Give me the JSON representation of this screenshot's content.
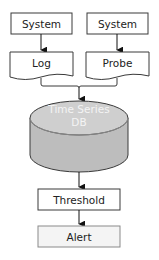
{
  "diagram": {
    "nodes": {
      "system_left": {
        "label": "System",
        "shape": "box"
      },
      "system_right": {
        "label": "System",
        "shape": "box"
      },
      "log": {
        "label": "Log",
        "shape": "document"
      },
      "probe": {
        "label": "Probe",
        "shape": "document"
      },
      "db": {
        "label_line1": "Time Series",
        "label_line2": "DB",
        "shape": "cylinder",
        "fill": "#bdbdbd",
        "top_fill": "#cfcfcf"
      },
      "threshold": {
        "label": "Threshold",
        "shape": "box"
      },
      "alert": {
        "label": "Alert",
        "shape": "box",
        "fill": "#f4f4f4"
      }
    },
    "edges": [
      {
        "from": "system_left",
        "to": "log",
        "arrow": "arrow-down"
      },
      {
        "from": "system_right",
        "to": "probe",
        "arrow": "arrow-down"
      },
      {
        "from": "log",
        "to": "db",
        "arrow": "bracket-merge"
      },
      {
        "from": "probe",
        "to": "db",
        "arrow": "bracket-merge"
      },
      {
        "from": "db",
        "to": "threshold",
        "arrow": "arrow-down"
      },
      {
        "from": "threshold",
        "to": "alert",
        "arrow": "arrow-down"
      }
    ]
  }
}
